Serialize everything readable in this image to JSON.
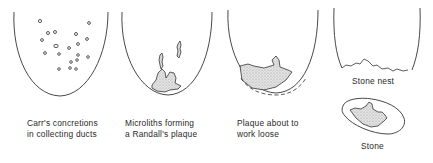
{
  "diagram": {
    "panels": [
      {
        "id": "carr",
        "line1": "Carr's concretions",
        "line2": "in collecting ducts"
      },
      {
        "id": "microliths",
        "line1": "Microliths forming",
        "line2": "a Randall's plaque"
      },
      {
        "id": "plaque",
        "line1": "Plaque about to",
        "line2": "work loose"
      },
      {
        "id": "nest",
        "line1": "Stone nest"
      },
      {
        "id": "stone",
        "line1": "Stone"
      }
    ],
    "colors": {
      "line": "#333333",
      "fill": "#d9d9d9"
    }
  }
}
